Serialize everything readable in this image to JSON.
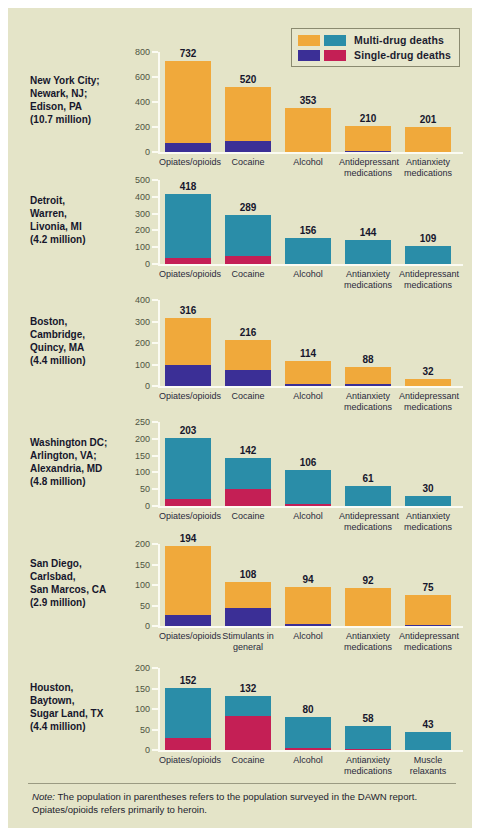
{
  "figure": {
    "background": "#e4e4c8",
    "note_prefix": "Note:",
    "note_line1": " The population in parentheses refers to the population surveyed in the DAWN report.",
    "note_line2": "Opiates/opioids refers primarily to heroin."
  },
  "legend": {
    "rows": [
      {
        "label": "Multi-drug deaths",
        "swatch_a": "#f0a93b",
        "swatch_b": "#2a8da8"
      },
      {
        "label": "Single-drug deaths",
        "swatch_a": "#3b2f96",
        "swatch_b": "#c41f55"
      }
    ]
  },
  "colors": {
    "orange": "#f0a93b",
    "teal": "#2a8da8",
    "purple": "#3b2f96",
    "crimson": "#c41f55",
    "axis": "#fbfbf2",
    "tick_text": "#4e5442",
    "label_text": "#16162c"
  },
  "chart_data": {
    "type": "bar",
    "title": "",
    "xlabel": "",
    "ylabel": "",
    "grid": false,
    "legend_position": "top-right",
    "stacked": true,
    "series": [
      {
        "name": "Multi-drug deaths"
      },
      {
        "name": "Single-drug deaths"
      }
    ],
    "panels": [
      {
        "city_lines": [
          "New York City;",
          "Newark, NJ;",
          "Edison, PA",
          "(10.7 million)"
        ],
        "population": "10.7 million",
        "multi_color": "#f0a93b",
        "single_color": "#3b2f96",
        "ylim": [
          0,
          800
        ],
        "yticks": [
          0,
          200,
          400,
          600,
          800
        ],
        "categories": [
          "Opiates/opioids",
          "Cocaine",
          "Alcohol",
          "Antidepressant medications",
          "Antianxiety medications"
        ],
        "values": [
          732,
          520,
          353,
          210,
          201
        ],
        "single_values": [
          70,
          92,
          0,
          10,
          0
        ]
      },
      {
        "city_lines": [
          "Detroit,",
          "Warren,",
          "Livonia, MI",
          "(4.2 million)"
        ],
        "population": "4.2 million",
        "multi_color": "#2a8da8",
        "single_color": "#c41f55",
        "ylim": [
          0,
          500
        ],
        "yticks": [
          0,
          100,
          200,
          300,
          400,
          500
        ],
        "categories": [
          "Opiates/opioids",
          "Cocaine",
          "Alcohol",
          "Antianxiety medications",
          "Antidepressant medications"
        ],
        "values": [
          418,
          289,
          156,
          144,
          109
        ],
        "single_values": [
          34,
          48,
          0,
          0,
          0
        ]
      },
      {
        "city_lines": [
          "Boston,",
          "Cambridge,",
          "Quincy, MA",
          "(4.4 million)"
        ],
        "population": "4.4 million",
        "multi_color": "#f0a93b",
        "single_color": "#3b2f96",
        "ylim": [
          0,
          400
        ],
        "yticks": [
          0,
          100,
          200,
          300,
          400
        ],
        "categories": [
          "Opiates/opioids",
          "Cocaine",
          "Alcohol",
          "Antianxiety medications",
          "Antidepressant medications"
        ],
        "values": [
          316,
          216,
          114,
          88,
          32
        ],
        "single_values": [
          99,
          75,
          7,
          8,
          0
        ]
      },
      {
        "city_lines": [
          "Washington DC;",
          "Arlington, VA;",
          "Alexandria, MD",
          "(4.8 million)"
        ],
        "population": "4.8 million",
        "multi_color": "#2a8da8",
        "single_color": "#c41f55",
        "ylim": [
          0,
          250
        ],
        "yticks": [
          0,
          50,
          100,
          150,
          200,
          250
        ],
        "categories": [
          "Opiates/opioids",
          "Cocaine",
          "Alcohol",
          "Antidepressant medications",
          "Antianxiety medications"
        ],
        "values": [
          203,
          142,
          106,
          61,
          30
        ],
        "single_values": [
          22,
          50,
          6,
          0,
          0
        ]
      },
      {
        "city_lines": [
          "San Diego,",
          "Carlsbad,",
          "San Marcos, CA",
          "(2.9 million)"
        ],
        "population": "2.9 million",
        "multi_color": "#f0a93b",
        "single_color": "#3b2f96",
        "ylim": [
          0,
          200
        ],
        "yticks": [
          0,
          50,
          100,
          150,
          200
        ],
        "categories": [
          "Opiates/opioids",
          "Stimulants in general",
          "Alcohol",
          "Antianxiety medications",
          "Antidepressant medications"
        ],
        "values": [
          194,
          108,
          94,
          92,
          75
        ],
        "single_values": [
          28,
          44,
          4,
          0,
          3
        ]
      },
      {
        "city_lines": [
          "Houston,",
          "Baytown,",
          "Sugar Land, TX",
          "(4.4 million)"
        ],
        "population": "4.4 million",
        "multi_color": "#2a8da8",
        "single_color": "#c41f55",
        "ylim": [
          0,
          200
        ],
        "yticks": [
          0,
          50,
          100,
          150,
          200
        ],
        "categories": [
          "Opiates/opioids",
          "Cocaine",
          "Alcohol",
          "Antianxiety medications",
          "Muscle relaxants"
        ],
        "values": [
          152,
          132,
          80,
          58,
          43
        ],
        "single_values": [
          30,
          83,
          4,
          3,
          0
        ]
      }
    ]
  }
}
